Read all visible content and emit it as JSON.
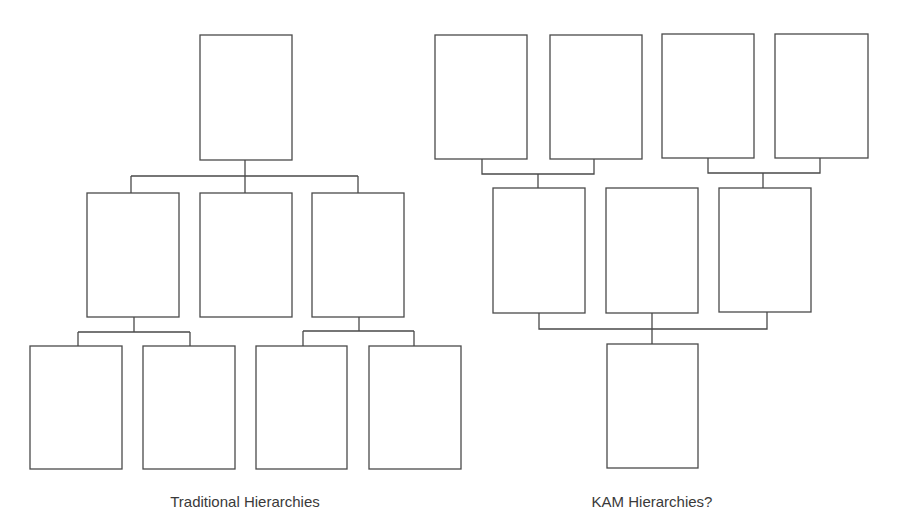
{
  "diagrams": [
    {
      "id": "traditional",
      "caption": "Traditional Hierarchies",
      "caption_center_x": 245,
      "levels": [
        {
          "level": 1,
          "boxes": 1
        },
        {
          "level": 2,
          "boxes": 3
        },
        {
          "level": 3,
          "boxes": 4
        }
      ]
    },
    {
      "id": "kam",
      "caption": "KAM Hierarchies?",
      "caption_center_x": 652,
      "levels": [
        {
          "level": 1,
          "boxes": 4
        },
        {
          "level": 2,
          "boxes": 3
        },
        {
          "level": 3,
          "boxes": 1
        }
      ]
    }
  ],
  "colors": {
    "stroke": "#4a4a4a",
    "background": "#ffffff",
    "text": "#3a3a3a"
  }
}
